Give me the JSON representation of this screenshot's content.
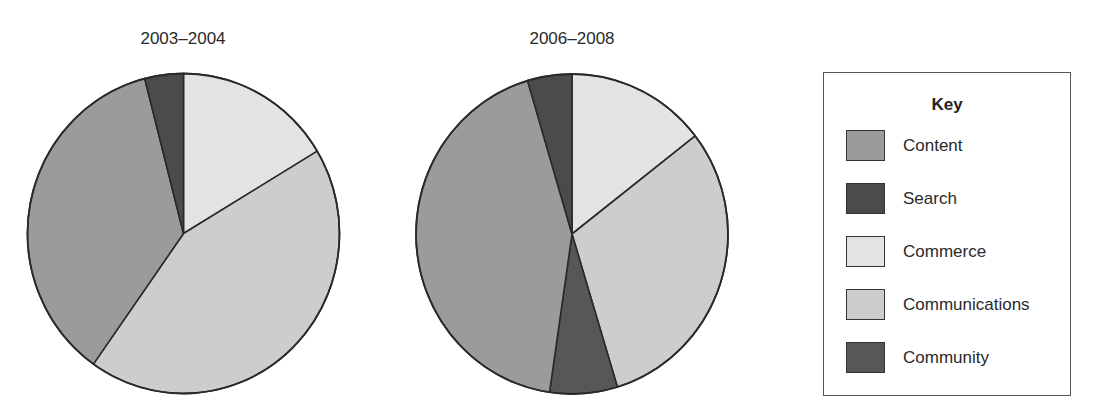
{
  "chart_data": [
    {
      "type": "pie",
      "title": "2003–2004",
      "start_angle_deg": 0,
      "direction": "clockwise",
      "slices": [
        {
          "label": "Commerce",
          "value": 16.4
        },
        {
          "label": "Communications",
          "value": 43.4
        },
        {
          "label": "Content",
          "value": 36.2
        },
        {
          "label": "Search",
          "value": 4.0
        }
      ]
    },
    {
      "type": "pie",
      "title": "2006–2008",
      "start_angle_deg": 0,
      "direction": "clockwise",
      "slices": [
        {
          "label": "Commerce",
          "value": 14.5
        },
        {
          "label": "Communications",
          "value": 30.8
        },
        {
          "label": "Community",
          "value": 7.0
        },
        {
          "label": "Content",
          "value": 43.1
        },
        {
          "label": "Search",
          "value": 4.6
        }
      ]
    }
  ],
  "legend": {
    "title": "Key",
    "items": [
      {
        "label": "Content",
        "color": "#9b9b9b"
      },
      {
        "label": "Search",
        "color": "#4b4b4b"
      },
      {
        "label": "Commerce",
        "color": "#e3e3e3"
      },
      {
        "label": "Communications",
        "color": "#cdcdcd"
      },
      {
        "label": "Community",
        "color": "#575757"
      }
    ]
  },
  "colors": {
    "Content": "#9b9b9b",
    "Search": "#4b4b4b",
    "Commerce": "#e3e3e3",
    "Communications": "#cdcdcd",
    "Community": "#575757",
    "outline": "#2a2a2a"
  }
}
